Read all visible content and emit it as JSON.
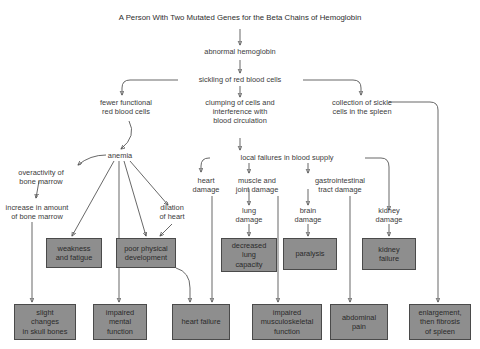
{
  "diagram": {
    "title": "A Person With Two Mutated Genes for the Beta Chains of Hemoglobin",
    "type": "flowchart",
    "box_fill_color": "#8e8e8e",
    "box_border_color": "#4a4a4a",
    "text_color": "#3a3a3a",
    "background_color": "#ffffff",
    "plain_nodes": [
      {
        "id": "abnormal_hemoglobin",
        "label": "abnormal hemoglobin"
      },
      {
        "id": "sickling",
        "label": "sickling of red blood cells"
      },
      {
        "id": "fewer_functional",
        "label": "fewer functional\nred blood cells"
      },
      {
        "id": "clumping",
        "label": "clumping of cells and\ninterference with\nblood circulation"
      },
      {
        "id": "collection_spleen",
        "label": "collection of sickle\ncells in the spleen"
      },
      {
        "id": "anemia",
        "label": "anemia"
      },
      {
        "id": "local_failures",
        "label": "local failures in blood supply"
      },
      {
        "id": "overactivity",
        "label": "overactivity of\nbone marrow"
      },
      {
        "id": "increase_marrow",
        "label": "increase in amount\nof bone marrow"
      },
      {
        "id": "dilation_heart",
        "label": "dilation\nof heart"
      },
      {
        "id": "heart_damage",
        "label": "heart\ndamage"
      },
      {
        "id": "muscle_joint_damage",
        "label": "muscle and\njoint damage"
      },
      {
        "id": "gi_tract_damage",
        "label": "gastrointestinal\ntract damage"
      },
      {
        "id": "lung_damage",
        "label": "lung\ndamage"
      },
      {
        "id": "brain_damage",
        "label": "brain\ndamage"
      },
      {
        "id": "kidney_damage",
        "label": "kidney\ndamage"
      }
    ],
    "outcome_boxes": [
      {
        "id": "weakness",
        "label": "weakness\nand fatigue"
      },
      {
        "id": "poor_physical",
        "label": "poor physical\ndevelopment"
      },
      {
        "id": "decreased_lung",
        "label": "decreased\nlung\ncapacity"
      },
      {
        "id": "paralysis",
        "label": "paralysis"
      },
      {
        "id": "kidney_failure",
        "label": "kidney\nfailure"
      },
      {
        "id": "slight_changes",
        "label": "slight\nchanges\nin skull bones"
      },
      {
        "id": "impaired_mental",
        "label": "impaired\nmental\nfunction"
      },
      {
        "id": "heart_failure",
        "label": "heart failure"
      },
      {
        "id": "impaired_musculo",
        "label": "impaired\nmusculoskeletal\nfunction"
      },
      {
        "id": "abdominal_pain",
        "label": "abdominal\npain"
      },
      {
        "id": "enlargement_spleen",
        "label": "enlargement,\nthen fibrosis\nof spleen"
      }
    ],
    "edges": [
      {
        "from": "title",
        "to": "abnormal_hemoglobin"
      },
      {
        "from": "abnormal_hemoglobin",
        "to": "sickling"
      },
      {
        "from": "sickling",
        "to": "fewer_functional"
      },
      {
        "from": "sickling",
        "to": "clumping"
      },
      {
        "from": "sickling",
        "to": "collection_spleen"
      },
      {
        "from": "fewer_functional",
        "to": "anemia"
      },
      {
        "from": "clumping",
        "to": "local_failures"
      },
      {
        "from": "collection_spleen",
        "to": "enlargement_spleen"
      },
      {
        "from": "anemia",
        "to": "overactivity"
      },
      {
        "from": "anemia",
        "to": "weakness"
      },
      {
        "from": "anemia",
        "to": "impaired_mental"
      },
      {
        "from": "anemia",
        "to": "poor_physical"
      },
      {
        "from": "anemia",
        "to": "dilation_heart"
      },
      {
        "from": "overactivity",
        "to": "increase_marrow"
      },
      {
        "from": "increase_marrow",
        "to": "slight_changes"
      },
      {
        "from": "dilation_heart",
        "to": "poor_physical"
      },
      {
        "from": "poor_physical",
        "to": "heart_failure"
      },
      {
        "from": "local_failures",
        "to": "heart_damage"
      },
      {
        "from": "local_failures",
        "to": "muscle_joint_damage"
      },
      {
        "from": "local_failures",
        "to": "gi_tract_damage"
      },
      {
        "from": "local_failures",
        "to": "kidney_damage"
      },
      {
        "from": "heart_damage",
        "to": "lung_damage"
      },
      {
        "from": "heart_damage",
        "to": "heart_failure"
      },
      {
        "from": "muscle_joint_damage",
        "to": "brain_damage"
      },
      {
        "from": "muscle_joint_damage",
        "to": "impaired_musculo"
      },
      {
        "from": "gi_tract_damage",
        "to": "abdominal_pain"
      },
      {
        "from": "gi_tract_damage",
        "to": "kidney_damage"
      },
      {
        "from": "lung_damage",
        "to": "decreased_lung"
      },
      {
        "from": "brain_damage",
        "to": "paralysis"
      },
      {
        "from": "kidney_damage",
        "to": "kidney_failure"
      }
    ]
  }
}
